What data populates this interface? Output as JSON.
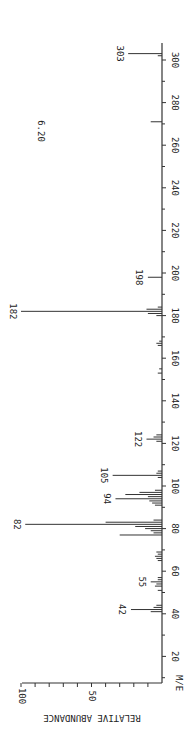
{
  "chart_data": {
    "type": "bar",
    "subtype": "mass-spectrum",
    "orientation": "rotated-90-ccw",
    "title": "",
    "annotation": "6.20",
    "xlabel": "M/E",
    "ylabel": "RELATIVE ABUNDANCE",
    "xlim": [
      0,
      300
    ],
    "ylim": [
      0,
      100
    ],
    "x_ticks": [
      20,
      40,
      60,
      80,
      100,
      120,
      140,
      160,
      180,
      200,
      220,
      240,
      260,
      280,
      300
    ],
    "y_ticks": [
      50,
      100
    ],
    "grid": false,
    "peaks": [
      {
        "mz": 41,
        "abundance": 8
      },
      {
        "mz": 42,
        "abundance": 22,
        "label": "42"
      },
      {
        "mz": 43,
        "abundance": 6
      },
      {
        "mz": 44,
        "abundance": 4
      },
      {
        "mz": 51,
        "abundance": 3
      },
      {
        "mz": 53,
        "abundance": 5
      },
      {
        "mz": 54,
        "abundance": 4
      },
      {
        "mz": 55,
        "abundance": 8,
        "label": "55"
      },
      {
        "mz": 56,
        "abundance": 3
      },
      {
        "mz": 57,
        "abundance": 3
      },
      {
        "mz": 65,
        "abundance": 3
      },
      {
        "mz": 66,
        "abundance": 4
      },
      {
        "mz": 67,
        "abundance": 5
      },
      {
        "mz": 68,
        "abundance": 3
      },
      {
        "mz": 69,
        "abundance": 4
      },
      {
        "mz": 77,
        "abundance": 30
      },
      {
        "mz": 78,
        "abundance": 6
      },
      {
        "mz": 79,
        "abundance": 8
      },
      {
        "mz": 80,
        "abundance": 12
      },
      {
        "mz": 81,
        "abundance": 19
      },
      {
        "mz": 82,
        "abundance": 97,
        "label": "82"
      },
      {
        "mz": 83,
        "abundance": 40
      },
      {
        "mz": 84,
        "abundance": 6
      },
      {
        "mz": 91,
        "abundance": 5
      },
      {
        "mz": 92,
        "abundance": 7
      },
      {
        "mz": 93,
        "abundance": 9
      },
      {
        "mz": 94,
        "abundance": 33,
        "label": "94"
      },
      {
        "mz": 95,
        "abundance": 10
      },
      {
        "mz": 96,
        "abundance": 26
      },
      {
        "mz": 97,
        "abundance": 16
      },
      {
        "mz": 98,
        "abundance": 5
      },
      {
        "mz": 104,
        "abundance": 3
      },
      {
        "mz": 105,
        "abundance": 35,
        "label": "105"
      },
      {
        "mz": 106,
        "abundance": 4
      },
      {
        "mz": 107,
        "abundance": 3
      },
      {
        "mz": 121,
        "abundance": 4
      },
      {
        "mz": 122,
        "abundance": 11,
        "label": "122"
      },
      {
        "mz": 123,
        "abundance": 6
      },
      {
        "mz": 124,
        "abundance": 4
      },
      {
        "mz": 153,
        "abundance": 3
      },
      {
        "mz": 155,
        "abundance": 2
      },
      {
        "mz": 166,
        "abundance": 3
      },
      {
        "mz": 167,
        "abundance": 4
      },
      {
        "mz": 168,
        "abundance": 2
      },
      {
        "mz": 180,
        "abundance": 4
      },
      {
        "mz": 181,
        "abundance": 10
      },
      {
        "mz": 182,
        "abundance": 100,
        "label": "182"
      },
      {
        "mz": 183,
        "abundance": 11
      },
      {
        "mz": 184,
        "abundance": 3
      },
      {
        "mz": 198,
        "abundance": 10,
        "label": "198"
      },
      {
        "mz": 271,
        "abundance": 8
      },
      {
        "mz": 302,
        "abundance": 3
      },
      {
        "mz": 303,
        "abundance": 24,
        "label": "303"
      }
    ]
  },
  "axis": {
    "x_label": "M/E",
    "y_label": "RELATIVE ABUNDANCE",
    "y_tick_labels": [
      "100",
      "50"
    ]
  },
  "annotation": "6.20"
}
